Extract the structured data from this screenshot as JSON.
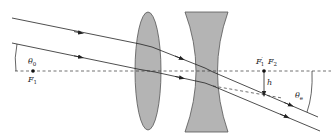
{
  "diagram": {
    "colors": {
      "lens_fill": "#b4b4b4",
      "lens_stroke": "#555555",
      "ray": "#222222",
      "axis": "#333333"
    },
    "labels": {
      "theta0": "θ",
      "theta0_sub": "0",
      "F1": "F",
      "F1_sub": "1",
      "F1prime": "F",
      "F1prime_mark": "′",
      "F1prime_sub": "1",
      "F2": "F",
      "F2_sub": "2",
      "h": "h",
      "thetae": "θ",
      "thetae_sub": "e"
    },
    "elements": {
      "lens1": "converging (biconvex) lens",
      "lens2": "diverging (biconcave) lens",
      "axis": "optical axis (dashed)",
      "rays": [
        "upper ray",
        "lower ray"
      ]
    }
  }
}
